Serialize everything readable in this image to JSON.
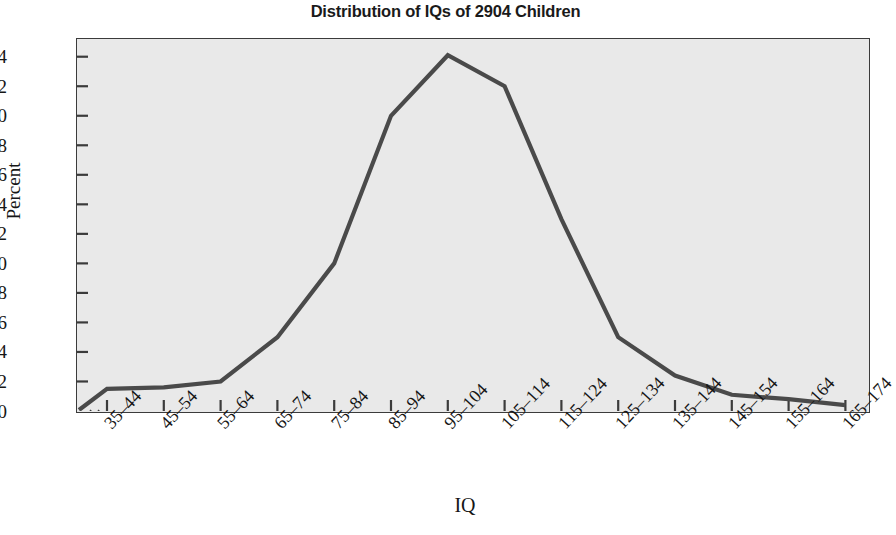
{
  "chart_data": {
    "type": "line",
    "title": "Distribution of IQs of 2904 Children",
    "xlabel": "IQ",
    "ylabel": "Percent",
    "categories": [
      "35–44",
      "45–54",
      "55–64",
      "65–74",
      "75–84",
      "85–94",
      "95–104",
      "105–114",
      "115–124",
      "125–134",
      "135–144",
      "145–154",
      "155–164",
      "165–174"
    ],
    "values": [
      1.5,
      1.6,
      2.0,
      5.0,
      10.0,
      20.0,
      24.1,
      22.0,
      13.0,
      5.0,
      2.4,
      1.1,
      0.8,
      0.4
    ],
    "ylim": [
      0,
      25.2
    ],
    "yticks": [
      0,
      2,
      4,
      6,
      8,
      10,
      12,
      14,
      16,
      18,
      20,
      22,
      24
    ],
    "ytick_labels": [
      "0",
      "2",
      "4",
      "6",
      "8",
      "10",
      "12",
      "14",
      "16",
      "18",
      "20",
      "22",
      "24"
    ],
    "grid": false,
    "legend": "none",
    "axis_break": "x-axis break near origin",
    "line_color": "#4a4a4a",
    "plot_background": "#e9e9e9",
    "frame_color": "#3b3b3b"
  }
}
